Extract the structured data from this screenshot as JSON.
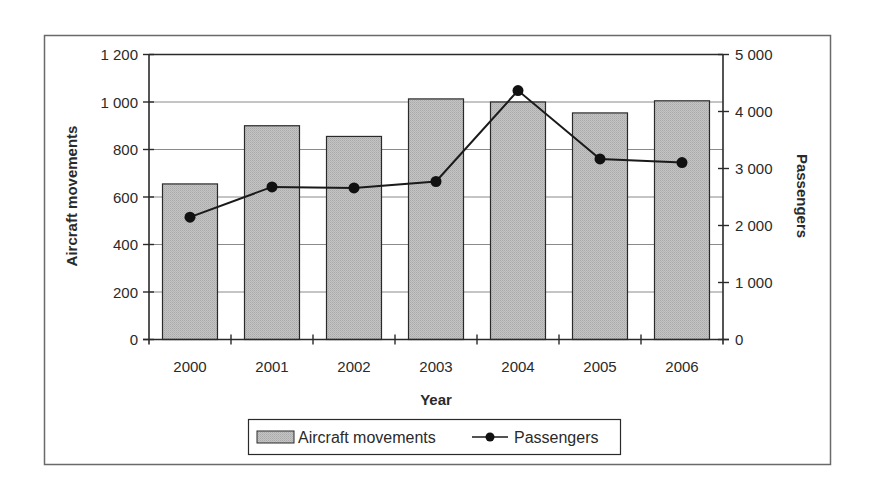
{
  "chart_data": {
    "type": "bar",
    "combo": "bar + line (secondary axis)",
    "title": "",
    "categories": [
      "2000",
      "2001",
      "2002",
      "2003",
      "2004",
      "2005",
      "2006"
    ],
    "series": [
      {
        "name": "Aircraft movements",
        "type": "bar",
        "axis": "left",
        "values": [
          655,
          900,
          855,
          1013,
          1000,
          954,
          1005
        ]
      },
      {
        "name": "Passengers",
        "type": "line",
        "axis": "right",
        "marker": "circle",
        "values": [
          2146,
          2677,
          2660,
          2772,
          4368,
          3168,
          3105
        ]
      }
    ],
    "xlabel": "Year",
    "ylabel": "Aircraft movements",
    "y2label": "Passengers",
    "ylim": [
      0,
      1200
    ],
    "y2lim": [
      0,
      5000
    ],
    "yticks": [
      0,
      200,
      400,
      600,
      800,
      1000,
      1200
    ],
    "ytick_labels": [
      "0",
      "200",
      "400",
      "600",
      "800",
      "1 000",
      "1 200"
    ],
    "y2ticks": [
      0,
      1000,
      2000,
      3000,
      4000,
      5000
    ],
    "y2tick_labels": [
      "0",
      "1 000",
      "2 000",
      "3 000",
      "4 000",
      "5 000"
    ],
    "grid": true,
    "legend_position": "bottom",
    "colors": {
      "bar_fill": "#bdbdbd",
      "bar_stroke": "#2a2a2a",
      "line": "#1a1a1a",
      "grid": "#8a8a8a",
      "frame": "#6a6a6a"
    }
  },
  "legend": {
    "items": [
      {
        "label": "Aircraft movements",
        "icon": "bar-swatch-icon"
      },
      {
        "label": "Passengers",
        "icon": "line-marker-icon"
      }
    ]
  }
}
